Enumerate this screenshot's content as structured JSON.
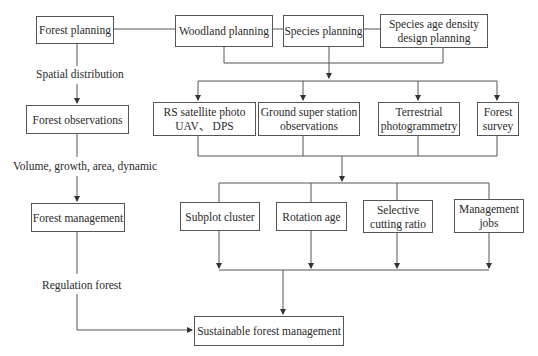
{
  "diagram": {
    "left_column": {
      "nodes": [
        {
          "id": "forest-planning",
          "label": "Forest planning"
        },
        {
          "id": "forest-observations",
          "label": "Forest observations"
        },
        {
          "id": "forest-management",
          "label": "Forest management"
        }
      ],
      "edge_labels": [
        {
          "id": "spatial-distribution",
          "label": "Spatial distribution"
        },
        {
          "id": "volume-growth",
          "label": "Volume, growth, area, dynamic"
        },
        {
          "id": "regulation-forest",
          "label": "Regulation forest"
        }
      ]
    },
    "planning_row": {
      "nodes": [
        {
          "id": "woodland-planning",
          "lines": [
            "Woodland planning"
          ]
        },
        {
          "id": "species-planning",
          "lines": [
            "Species planning"
          ]
        },
        {
          "id": "species-age-density",
          "lines": [
            "Species age density",
            "design planning"
          ]
        }
      ]
    },
    "observation_row": {
      "nodes": [
        {
          "id": "rs-satellite",
          "lines": [
            "RS satellite photo",
            "UAV、 DPS"
          ]
        },
        {
          "id": "ground-station",
          "lines": [
            "Ground super station",
            "observations"
          ]
        },
        {
          "id": "terrestrial-photogrammetry",
          "lines": [
            "Terrestrial",
            "photogrammetry"
          ]
        },
        {
          "id": "forest-survey",
          "lines": [
            "Forest",
            "survey"
          ]
        }
      ]
    },
    "management_row": {
      "nodes": [
        {
          "id": "subplot-cluster",
          "lines": [
            "Subplot cluster"
          ]
        },
        {
          "id": "rotation-age",
          "lines": [
            "Rotation age"
          ]
        },
        {
          "id": "selective-cutting",
          "lines": [
            "Selective",
            "cutting ratio"
          ]
        },
        {
          "id": "management-jobs",
          "lines": [
            "Management",
            "jobs"
          ]
        }
      ]
    },
    "goal": {
      "label": "Sustainable forest management"
    },
    "colors": {
      "line": "#444444",
      "border": "#555555",
      "text": "#2a2a2a",
      "background": "#ffffff"
    }
  }
}
